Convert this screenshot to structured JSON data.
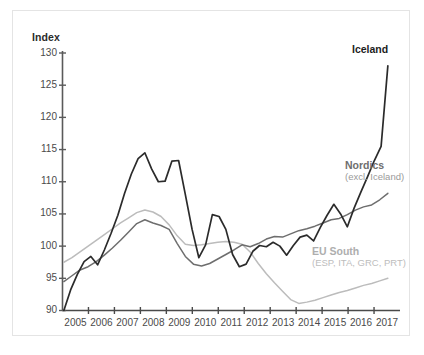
{
  "chart_data": {
    "type": "line",
    "title": "",
    "xlabel": "",
    "ylabel": "Index",
    "ylim": [
      90,
      130
    ],
    "xlim": [
      2004.5,
      2017.0
    ],
    "yticks": [
      90,
      95,
      100,
      105,
      110,
      115,
      120,
      125,
      130
    ],
    "ytick_labels": [
      "90",
      "95",
      "100",
      "105",
      "110",
      "115",
      "120",
      "125",
      "130"
    ],
    "xtick_labels": [
      "2005",
      "2006",
      "2007",
      "2008",
      "2009",
      "2010",
      "2011",
      "2012",
      "2013",
      "2014",
      "2015",
      "2016",
      "2017"
    ],
    "grid": false,
    "legend_position": "inline-annotations",
    "series": [
      {
        "name": "Iceland",
        "label_main": "Iceland",
        "label_sub": "",
        "color": "#2b2b2b",
        "x": [
          2004.55,
          2004.8,
          2005.05,
          2005.3,
          2005.55,
          2005.8,
          2006.05,
          2006.3,
          2006.55,
          2006.8,
          2007.05,
          2007.3,
          2007.55,
          2007.8,
          2008.05,
          2008.3,
          2008.55,
          2008.8,
          2009.05,
          2009.3,
          2009.55,
          2009.8,
          2010.05,
          2010.3,
          2010.55,
          2010.8,
          2011.05,
          2011.3,
          2011.55,
          2011.8,
          2012.05,
          2012.3,
          2012.55,
          2012.8,
          2013.05,
          2013.3,
          2013.55,
          2013.8,
          2014.05,
          2014.3,
          2014.55,
          2014.8,
          2015.05,
          2015.3,
          2015.55,
          2015.8,
          2016.05,
          2016.3,
          2016.55
        ],
        "y": [
          90.0,
          93.2,
          95.6,
          97.6,
          98.4,
          97.1,
          99.4,
          102.0,
          104.8,
          108.2,
          111.2,
          113.6,
          114.5,
          112.0,
          110.0,
          110.1,
          113.2,
          113.3,
          108.0,
          102.6,
          98.2,
          100.2,
          104.9,
          104.6,
          102.6,
          98.7,
          96.8,
          97.2,
          99.2,
          100.1,
          99.9,
          100.6,
          100.0,
          98.6,
          100.1,
          101.4,
          101.7,
          100.8,
          102.9,
          104.8,
          106.5,
          105.0,
          103.0,
          105.9,
          108.4,
          110.8,
          113.3,
          115.5,
          128.0
        ]
      },
      {
        "name": "Nordics (excl. Iceland)",
        "label_main": "Nordics",
        "label_sub": "(excl. Iceland)",
        "color": "#6e6e6e",
        "x": [
          2004.55,
          2004.85,
          2005.15,
          2005.45,
          2005.75,
          2006.05,
          2006.35,
          2006.65,
          2006.95,
          2007.25,
          2007.55,
          2007.85,
          2008.15,
          2008.45,
          2008.75,
          2009.05,
          2009.35,
          2009.65,
          2009.95,
          2010.25,
          2010.55,
          2010.85,
          2011.15,
          2011.45,
          2011.75,
          2012.05,
          2012.35,
          2012.65,
          2012.95,
          2013.25,
          2013.55,
          2013.85,
          2014.15,
          2014.45,
          2014.75,
          2015.05,
          2015.35,
          2015.65,
          2015.95,
          2016.25,
          2016.55
        ],
        "y": [
          94.5,
          95.4,
          96.3,
          96.8,
          97.6,
          98.6,
          99.7,
          100.9,
          102.2,
          103.5,
          104.1,
          103.6,
          103.2,
          102.6,
          100.4,
          98.4,
          97.2,
          96.9,
          97.3,
          98.0,
          98.7,
          99.4,
          100.2,
          99.9,
          100.4,
          101.1,
          101.5,
          101.4,
          101.9,
          102.4,
          102.7,
          103.1,
          103.6,
          104.1,
          104.3,
          104.9,
          105.6,
          106.1,
          106.4,
          107.2,
          108.2
        ]
      },
      {
        "name": "EU South (ESP, ITA, GRC, PRT)",
        "label_main": "EU South",
        "label_sub": "(ESP, ITA, GRC, PRT)",
        "color": "#bcbcbc",
        "x": [
          2004.55,
          2004.85,
          2005.15,
          2005.45,
          2005.75,
          2006.05,
          2006.35,
          2006.65,
          2006.95,
          2007.25,
          2007.55,
          2007.85,
          2008.15,
          2008.45,
          2008.75,
          2009.05,
          2009.35,
          2009.65,
          2009.95,
          2010.25,
          2010.55,
          2010.85,
          2011.15,
          2011.45,
          2011.75,
          2012.05,
          2012.35,
          2012.65,
          2012.95,
          2013.25,
          2013.55,
          2013.85,
          2014.15,
          2014.45,
          2014.75,
          2015.05,
          2015.35,
          2015.65,
          2015.95,
          2016.25,
          2016.55
        ],
        "y": [
          97.5,
          98.2,
          99.1,
          100.0,
          100.9,
          101.8,
          102.7,
          103.6,
          104.4,
          105.2,
          105.6,
          105.3,
          104.6,
          103.3,
          101.6,
          100.3,
          100.1,
          100.2,
          100.4,
          100.6,
          100.7,
          100.6,
          100.3,
          99.1,
          97.3,
          95.7,
          94.3,
          93.0,
          91.7,
          91.1,
          91.3,
          91.6,
          92.0,
          92.4,
          92.8,
          93.1,
          93.5,
          93.9,
          94.2,
          94.6,
          95.0
        ]
      }
    ]
  },
  "labels": {
    "y_axis_title": "Index"
  }
}
